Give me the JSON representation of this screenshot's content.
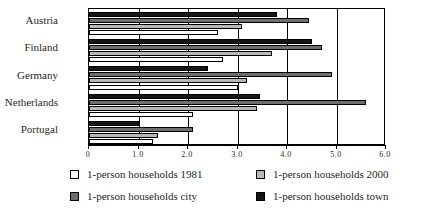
{
  "chart_data": {
    "type": "bar",
    "orientation": "horizontal",
    "title": "",
    "xlabel": "",
    "ylabel": "",
    "xlim": [
      0,
      6.0
    ],
    "grid": true,
    "legend_position": "bottom",
    "categories": [
      "Austria",
      "Finland",
      "Germany",
      "Netherlands",
      "Portugal"
    ],
    "tick_labels": [
      "0",
      "1.0",
      "2.0",
      "3.0",
      "4.0",
      "5.0",
      "6.0"
    ],
    "tick_values": [
      0,
      1.0,
      2.0,
      3.0,
      4.0,
      5.0,
      6.0
    ],
    "series": [
      {
        "name": "1-person households 1981",
        "key": "y1981",
        "color": "#ffffff",
        "values": [
          2.6,
          2.7,
          3.0,
          2.1,
          1.3
        ]
      },
      {
        "name": "1-person households 2000",
        "key": "y2000",
        "color": "#b8b8b8",
        "values": [
          3.1,
          3.7,
          3.2,
          3.4,
          1.4
        ]
      },
      {
        "name": "1-person households city",
        "key": "city",
        "color": "#6e6e6e",
        "values": [
          4.45,
          4.7,
          4.9,
          5.6,
          2.1
        ]
      },
      {
        "name": "1-person households town",
        "key": "town",
        "color": "#161616",
        "values": [
          3.8,
          4.5,
          2.4,
          3.45,
          1.0
        ]
      }
    ]
  },
  "legend": {
    "items": [
      {
        "label": "1-person households 1981",
        "swatch": "sw-1981"
      },
      {
        "label": "1-person households 2000",
        "swatch": "sw-2000"
      },
      {
        "label": "1-person households city",
        "swatch": "sw-city"
      },
      {
        "label": "1-person households town",
        "swatch": "sw-town"
      }
    ]
  }
}
